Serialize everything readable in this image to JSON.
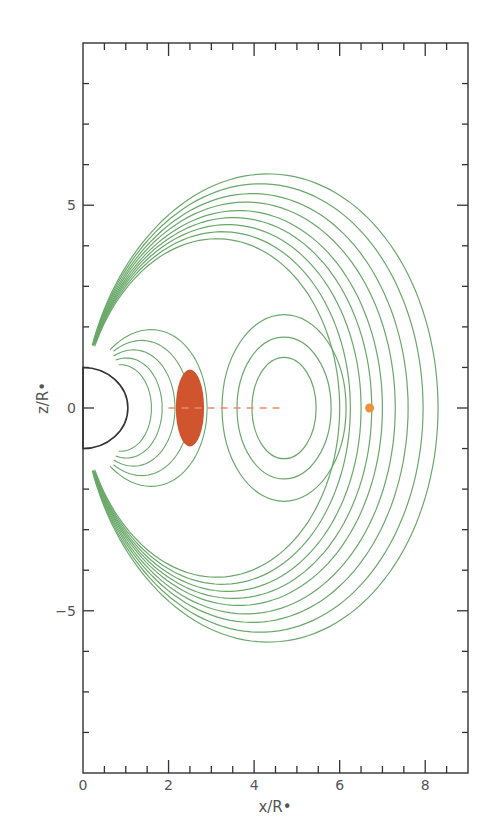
{
  "chart_data": {
    "type": "line",
    "title": "",
    "xlabel": "x/R•",
    "ylabel": "z/R•",
    "xlim": [
      0,
      9
    ],
    "ylim": [
      -9,
      9
    ],
    "grid": false,
    "legend": null,
    "x_ticks": [
      0,
      2,
      4,
      6,
      8
    ],
    "x_tick_labels": [
      "0",
      "2",
      "4",
      "6",
      "8"
    ],
    "x_minor_step": 0.5,
    "y_ticks": [
      -5,
      0,
      5
    ],
    "y_tick_labels": [
      "−5",
      "0",
      "5"
    ],
    "y_minor_step": 1,
    "star": {
      "shape": "half-disk",
      "center": [
        0,
        0
      ],
      "radius": 1.0,
      "color": "#333333"
    },
    "field_lines": {
      "description": "Dipole-like magnetic field line contours around star, with closed loops around a neutral point near x≈4.7",
      "color": "#6aa86a",
      "open_line_apex_x": [
        8.3,
        7.95,
        7.6,
        7.3,
        7.0,
        6.75,
        6.5,
        6.25,
        6.0
      ],
      "closed_loop_centers_x": 4.7,
      "closed_loop_semi_axes": [
        [
          0.75,
          1.25
        ],
        [
          1.1,
          1.75
        ],
        [
          1.45,
          2.3
        ]
      ],
      "outermost_z_extent": 6.9,
      "x_point": [
        1.6,
        0
      ]
    },
    "annotations": [
      {
        "type": "ellipse",
        "label": "dense material",
        "center": [
          2.5,
          0
        ],
        "rx": 0.33,
        "rz": 0.95,
        "color": "#d0542e"
      },
      {
        "type": "dashed-line",
        "from": [
          2.0,
          0
        ],
        "to": [
          4.7,
          0
        ],
        "color": "#e98c6a"
      },
      {
        "type": "dot",
        "center": [
          6.7,
          0
        ],
        "radius": 0.13,
        "color": "#f0923a"
      }
    ]
  }
}
